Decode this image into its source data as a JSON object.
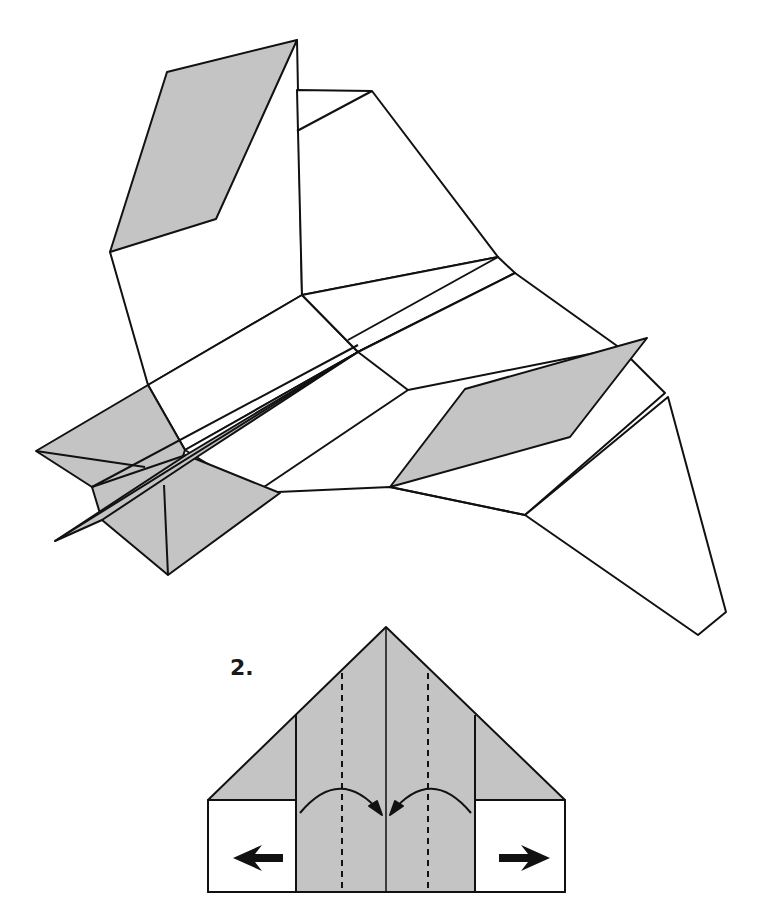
{
  "diagram": {
    "colors": {
      "paper_gray": "#c4c4c4",
      "paper_white": "#ffffff",
      "line": "#111111"
    },
    "finished_model": {
      "description": "Completed paper jet with gray wing-tip and tail markings"
    },
    "step": {
      "number_label": "2.",
      "instruction_marks": [
        {
          "type": "valley-fold-dashed-line",
          "side": "left"
        },
        {
          "type": "valley-fold-dashed-line",
          "side": "right"
        },
        {
          "type": "fold-arrow",
          "direction": "left-to-center"
        },
        {
          "type": "fold-arrow",
          "direction": "right-to-center"
        },
        {
          "type": "push-arrow",
          "direction": "left"
        },
        {
          "type": "push-arrow",
          "direction": "right"
        }
      ]
    }
  }
}
